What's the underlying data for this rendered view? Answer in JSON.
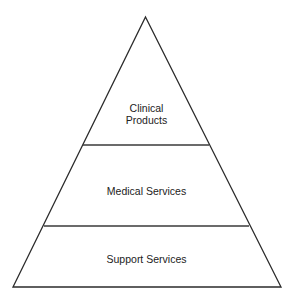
{
  "diagram": {
    "type": "pyramid",
    "levels": [
      {
        "position": "top",
        "label_line1": "Clinical",
        "label_line2": "Products"
      },
      {
        "position": "middle",
        "label": "Medical Services"
      },
      {
        "position": "bottom",
        "label": "Support Services"
      }
    ],
    "colors": {
      "stroke": "#2b2b2b",
      "fill": "#ffffff",
      "text": "#222222"
    }
  }
}
